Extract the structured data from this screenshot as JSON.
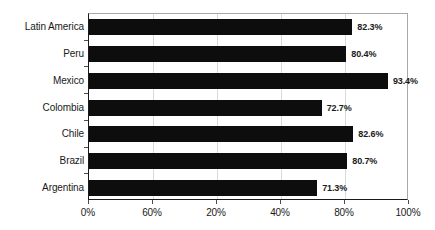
{
  "chart_data": {
    "type": "bar",
    "orientation": "horizontal",
    "title": "",
    "subtitle": "",
    "xlabel": "",
    "ylabel": "",
    "xlim": [
      0,
      100
    ],
    "grid": true,
    "legend": null,
    "legend_position": "none",
    "bar_color": "#0d0d0d",
    "gridline_color": "#d9d9d9",
    "axis_color": "#1a1a1a",
    "categories": [
      "Latin America",
      "Peru",
      "Mexico",
      "Colombia",
      "Chile",
      "Brazil",
      "Argentina"
    ],
    "values": [
      82.3,
      80.4,
      93.4,
      72.7,
      82.6,
      80.7,
      71.3
    ],
    "data_labels": [
      "82.3%",
      "80.4%",
      "93.4%",
      "72.7%",
      "82.6%",
      "80.7%",
      "71.3%"
    ],
    "xticks": [
      0,
      20,
      40,
      60,
      80,
      100
    ],
    "xtick_labels": [
      "0%",
      "60%",
      "20%",
      "40%",
      "80%",
      "100%"
    ]
  }
}
